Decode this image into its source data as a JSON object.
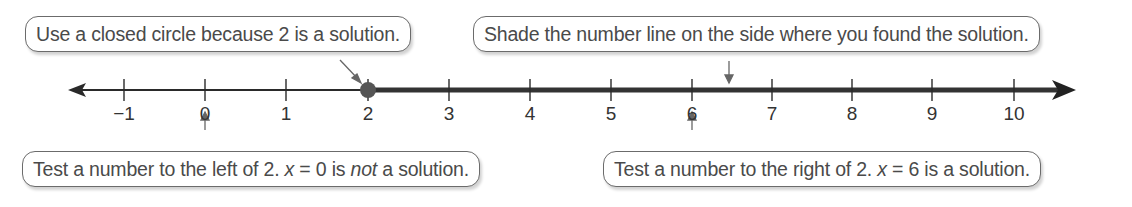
{
  "diagram": {
    "type": "number-line",
    "inequality_solution_boundary": 2,
    "boundary_point": "closed-circle",
    "shaded_direction": "right",
    "colors": {
      "line": "#222222",
      "point": "#555555",
      "callout_border": "#6b6b6b",
      "text": "#4a4a4a"
    }
  },
  "ticks": [
    {
      "value": -1,
      "label": "−1",
      "x": 124
    },
    {
      "value": 0,
      "label": "0",
      "x": 205
    },
    {
      "value": 1,
      "label": "1",
      "x": 286
    },
    {
      "value": 2,
      "label": "2",
      "x": 368
    },
    {
      "value": 3,
      "label": "3",
      "x": 449
    },
    {
      "value": 4,
      "label": "4",
      "x": 530
    },
    {
      "value": 5,
      "label": "5",
      "x": 611
    },
    {
      "value": 6,
      "label": "6",
      "x": 692
    },
    {
      "value": 7,
      "label": "7",
      "x": 772
    },
    {
      "value": 8,
      "label": "8",
      "x": 852
    },
    {
      "value": 9,
      "label": "9",
      "x": 932
    },
    {
      "value": 10,
      "label": "10",
      "x": 1014
    }
  ],
  "callouts": {
    "closed_circle": "Use a closed circle because 2 is a solution.",
    "shade": "Shade the number line on the side where you found the solution.",
    "left_test": {
      "pre": "Test a number to the left of 2. ",
      "var": "x",
      "eq": " = 0 is ",
      "emph": "not",
      "post": " a solution."
    },
    "right_test": {
      "pre": "Test a number to the right of 2. ",
      "var": "x",
      "eq": " = 6 is a solution."
    }
  }
}
